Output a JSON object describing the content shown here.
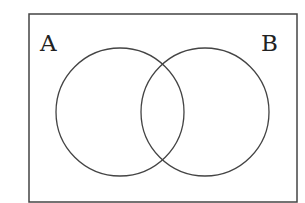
{
  "diagram": {
    "type": "venn",
    "universe_box": {
      "x": 29,
      "y": 14,
      "width": 268,
      "height": 188,
      "stroke": "#444444"
    },
    "sets": [
      {
        "label": "A",
        "cx": 120,
        "cy": 112,
        "r": 64,
        "label_x": 41,
        "label_y": 50
      },
      {
        "label": "B",
        "cx": 205,
        "cy": 112,
        "r": 64,
        "label_x": 261,
        "label_y": 50
      }
    ],
    "stroke_color": "#444444",
    "background": "#ffffff"
  }
}
